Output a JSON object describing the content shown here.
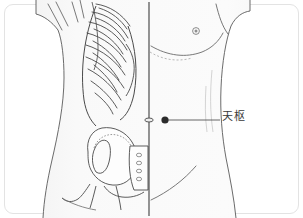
{
  "figure": {
    "kind": "anatomical-acupoint-illustration",
    "region": "abdomen",
    "view": "anterior",
    "composition": "left half shows skeleton (ribs, ilium, sacrum); right half shows skin surface",
    "background_color": "#ffffff",
    "frame_color": "#e3e3e3",
    "skin_fill": "#fbfbfb",
    "skin_shade": "#f0f0f0",
    "outline_color": "#555555",
    "bone_line_color": "#4a4a4a",
    "midline_color": "#3d3d3d",
    "point_color": "#2b2b2b",
    "leader_color": "#555555",
    "label_color": "#3a3a3a"
  },
  "annotations": {
    "acupoint": {
      "label": "天枢",
      "marker": "filled-dot",
      "marker_x": 165,
      "marker_y": 120,
      "leader_x_end": 220,
      "leader_y": 120
    },
    "landmarks": [
      {
        "name": "umbilicus",
        "x": 149,
        "y": 120
      },
      {
        "name": "nipple",
        "x": 196,
        "y": 31
      }
    ]
  },
  "structures": {
    "skeleton_side": "left",
    "skin_side": "right",
    "bones": [
      "ribs",
      "costal-margin",
      "ilium",
      "sacrum",
      "pubis"
    ],
    "surface_features": [
      "nipple",
      "umbilicus",
      "costal-margin-fold",
      "inguinal-fold"
    ]
  }
}
